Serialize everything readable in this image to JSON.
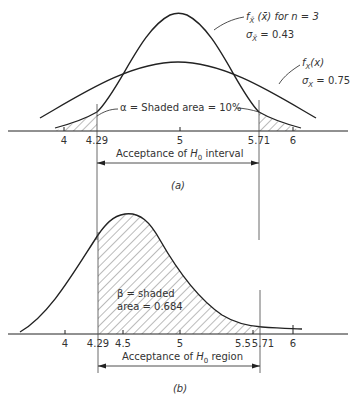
{
  "panel_a": {
    "caption": "(a)",
    "curve1_label_line1": "f_X̄(x̄) for n = 3",
    "curve1_label_line2": "σ_X̄ = 0.43",
    "curve2_label_line1": "f_X(x)",
    "curve2_label_line2": "σ_X = 0.75",
    "alpha_label": "α = Shaded area = 10%",
    "interval_label": "Acceptance of H₀ interval",
    "ticks": [
      "4",
      "4.29",
      "5",
      "5.71",
      "6"
    ]
  },
  "panel_b": {
    "caption": "(b)",
    "beta_label_line1": "β = shaded",
    "beta_label_line2": "area = 0.684",
    "region_label": "Acceptance of H₀ region",
    "ticks": [
      "4",
      "4.29",
      "4.5",
      "5",
      "5.5",
      "5.71",
      "6"
    ]
  },
  "text": {
    "fx_bar": "f",
    "for_n3": "(x̄) for n = 3",
    "sigma_xbar": "σ",
    "sigma_xbar_val": "= 0.43",
    "fx": "f",
    "fx_arg": "(x)",
    "sigma_x_val": "= 0.75",
    "alpha": "α = Shaded  area = 10%",
    "acc_a_pre": "Acceptance of ",
    "acc_a_post": " interval",
    "acc_b_post": " region",
    "H": "H",
    "zero": "0",
    "beta1": "β = shaded",
    "beta2": "area = 0.684",
    "cap_a": "(a)",
    "cap_b": "(b)",
    "t4": "4",
    "t429": "4.29",
    "t45": "4.5",
    "t5": "5",
    "t55": "5.5",
    "t571": "5.71",
    "t6": "6"
  }
}
